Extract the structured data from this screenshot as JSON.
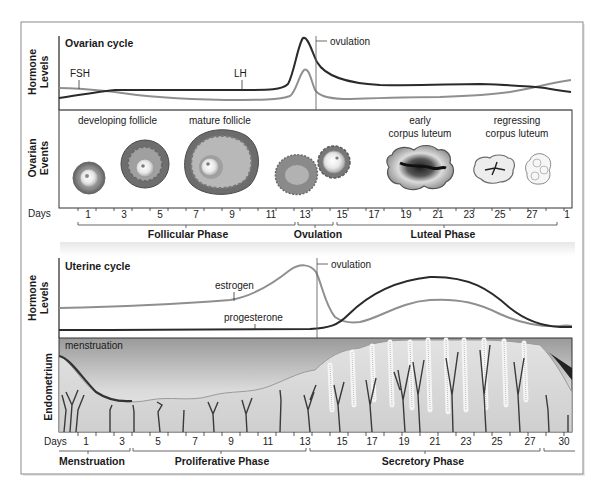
{
  "ovarian": {
    "title": "Ovarian cycle",
    "y_axis_label_line1": "Hormone",
    "y_axis_label_line2": "Levels",
    "events_axis_label_line1": "Ovarian",
    "events_axis_label_line2": "Events",
    "hormone_labels": {
      "fsh": "FSH",
      "lh": "LH",
      "ovulation": "ovulation"
    },
    "event_labels": {
      "developing_follicle": "developing follicle",
      "mature_follicle": "mature follicle",
      "early_cl_line1": "early",
      "early_cl_line2": "corpus luteum",
      "regressing_cl_line1": "regressing",
      "regressing_cl_line2": "corpus luteum"
    },
    "days_label": "Days",
    "days": [
      "1",
      "3",
      "5",
      "7",
      "9",
      "11",
      "13",
      "15",
      "17",
      "19",
      "21",
      "23",
      "25",
      "27",
      "1"
    ],
    "phases": [
      "Follicular Phase",
      "Ovulation",
      "Luteal Phase"
    ]
  },
  "uterine": {
    "title": "Uterine cycle",
    "y_axis_label_line1": "Hormone",
    "y_axis_label_line2": "Levels",
    "endometrium_label": "Endometrium",
    "hormone_labels": {
      "estrogen": "estrogen",
      "progesterone": "progesterone",
      "ovulation": "ovulation"
    },
    "endometrium_caption": "menstruation",
    "days_label": "Days",
    "days": [
      "1",
      "3",
      "5",
      "7",
      "9",
      "11",
      "13",
      "15",
      "17",
      "19",
      "21",
      "23",
      "25",
      "27",
      "30"
    ],
    "phases": [
      "Menstruation",
      "Proliferative Phase",
      "Secretory Phase"
    ]
  },
  "colors": {
    "dark_curve": "#2a2a2a",
    "light_curve": "#8f8f8f",
    "frame": "#9a9a9a",
    "follicle_outer": "#7a7a7a",
    "endometrium_bg": "#cfcfcf"
  }
}
